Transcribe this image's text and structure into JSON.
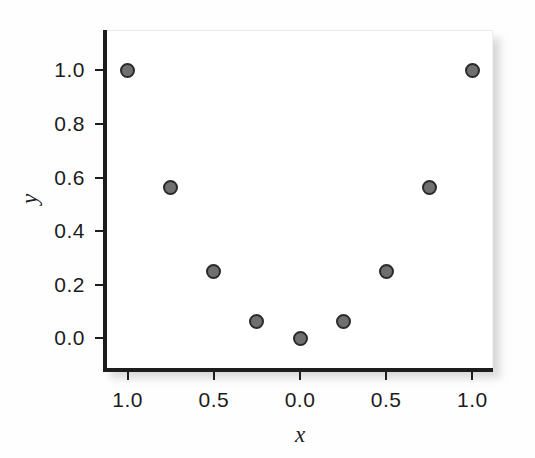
{
  "chart_data": {
    "type": "scatter",
    "title": "",
    "xlabel": "x",
    "ylabel": "y",
    "xtick_labels": [
      "1.0",
      "0.5",
      "0.0",
      "0.5",
      "1.0"
    ],
    "xtick_values": [
      -1.0,
      -0.5,
      0.0,
      0.5,
      1.0
    ],
    "ytick_labels": [
      "1.0",
      "0.8",
      "0.6",
      "0.4",
      "0.2",
      "0.0"
    ],
    "ytick_values": [
      1.0,
      0.8,
      0.6,
      0.4,
      0.2,
      0.0
    ],
    "xlim": [
      -1.12,
      1.12
    ],
    "ylim": [
      -0.11,
      1.15
    ],
    "grid": false,
    "legend": false,
    "marker_color": "#6f6f6f",
    "marker_edge_color": "#2a2a2a",
    "axis_color": "#1d1d1d",
    "background_color": "#ffffff",
    "points": [
      {
        "x": -1.0,
        "y": 1.0,
        "label": "1.0"
      },
      {
        "x": -0.75,
        "y": 0.5625,
        "label": "0.56"
      },
      {
        "x": -0.5,
        "y": 0.25,
        "label": "0.25"
      },
      {
        "x": -0.25,
        "y": 0.0625,
        "label": "0.06"
      },
      {
        "x": 0.0,
        "y": 0.0,
        "label": "0.0"
      },
      {
        "x": 0.25,
        "y": 0.0625,
        "label": "0.06"
      },
      {
        "x": 0.5,
        "y": 0.25,
        "label": "0.25"
      },
      {
        "x": 0.75,
        "y": 0.5625,
        "label": "0.56"
      },
      {
        "x": 1.0,
        "y": 1.0,
        "label": "1.0"
      }
    ],
    "x": [
      -1.0,
      -0.75,
      -0.5,
      -0.25,
      0.0,
      0.25,
      0.5,
      0.75,
      1.0
    ],
    "values": [
      1.0,
      0.5625,
      0.25,
      0.0625,
      0.0,
      0.0625,
      0.25,
      0.5625,
      1.0
    ]
  }
}
